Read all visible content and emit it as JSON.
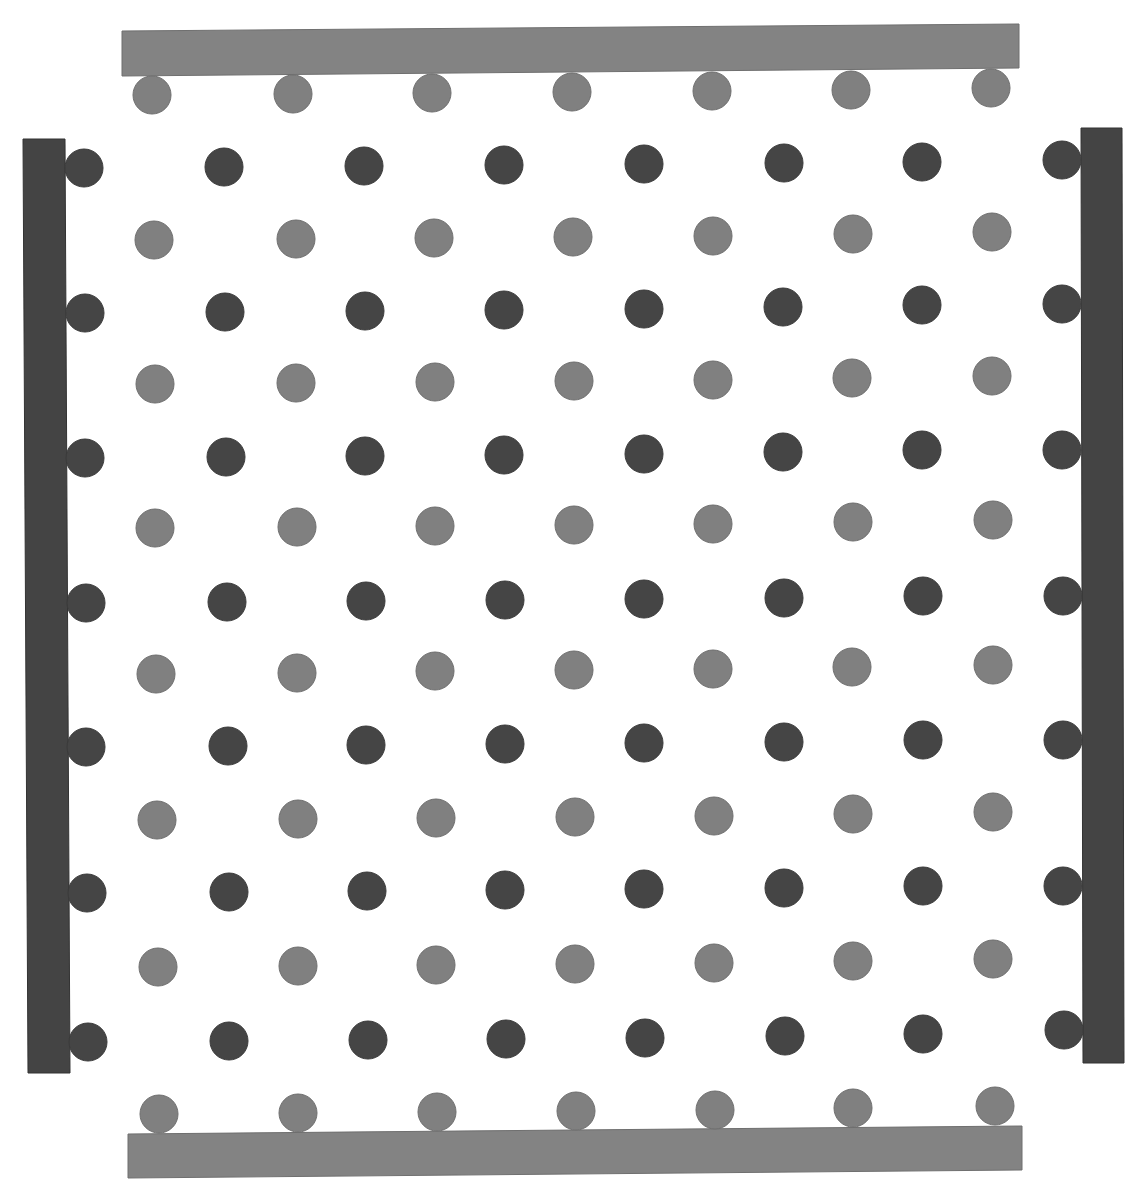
{
  "diagram": {
    "width": 1146,
    "height": 1200,
    "background": "#ffffff",
    "colors": {
      "dark_particle": "#454545",
      "light_particle": "#808080",
      "dark_plate": "#444444",
      "light_plate": "#838383"
    },
    "particle_radius": 19,
    "plates": [
      {
        "name": "top-plate",
        "kind": "light",
        "points": [
          [
            122,
            31
          ],
          [
            1019,
            24
          ],
          [
            1019,
            68
          ],
          [
            122,
            76
          ]
        ]
      },
      {
        "name": "bottom-plate",
        "kind": "light",
        "points": [
          [
            128,
            1134
          ],
          [
            1022,
            1126
          ],
          [
            1022,
            1170
          ],
          [
            128,
            1178
          ]
        ]
      },
      {
        "name": "left-plate",
        "kind": "dark",
        "points": [
          [
            23,
            139
          ],
          [
            65,
            139
          ],
          [
            70,
            1073
          ],
          [
            28,
            1073
          ]
        ]
      },
      {
        "name": "right-plate",
        "kind": "dark",
        "points": [
          [
            1081,
            128
          ],
          [
            1122,
            128
          ],
          [
            1124,
            1063
          ],
          [
            1083,
            1063
          ]
        ]
      }
    ],
    "light_rows": [
      {
        "y": [
          95,
          94,
          93,
          92,
          91,
          90,
          88
        ],
        "x": [
          152,
          293,
          432,
          572,
          712,
          851,
          991
        ]
      },
      {
        "y": [
          240,
          239,
          238,
          237,
          236,
          234,
          232
        ],
        "x": [
          154,
          296,
          434,
          573,
          713,
          853,
          992
        ]
      },
      {
        "y": [
          384,
          383,
          382,
          381,
          380,
          378,
          376
        ],
        "x": [
          155,
          296,
          435,
          574,
          713,
          852,
          992
        ]
      },
      {
        "y": [
          528,
          527,
          526,
          525,
          524,
          522,
          520
        ],
        "x": [
          155,
          297,
          435,
          574,
          713,
          853,
          993
        ]
      },
      {
        "y": [
          674,
          673,
          671,
          670,
          669,
          667,
          665
        ],
        "x": [
          156,
          297,
          435,
          574,
          713,
          852,
          993
        ]
      },
      {
        "y": [
          820,
          819,
          818,
          817,
          816,
          814,
          812
        ],
        "x": [
          157,
          298,
          436,
          575,
          714,
          853,
          993
        ]
      },
      {
        "y": [
          967,
          966,
          965,
          964,
          963,
          961,
          959
        ],
        "x": [
          158,
          298,
          436,
          575,
          714,
          853,
          993
        ]
      },
      {
        "y": [
          1114,
          1113,
          1112,
          1111,
          1110,
          1108,
          1106
        ],
        "x": [
          159,
          298,
          437,
          576,
          715,
          853,
          995
        ]
      }
    ],
    "dark_rows": [
      {
        "y": [
          168,
          167,
          166,
          165,
          164,
          163,
          162,
          160
        ],
        "x": [
          84,
          224,
          364,
          504,
          644,
          784,
          922,
          1062
        ]
      },
      {
        "y": [
          313,
          312,
          311,
          310,
          309,
          307,
          305,
          304
        ],
        "x": [
          85,
          225,
          365,
          504,
          644,
          783,
          922,
          1062
        ]
      },
      {
        "y": [
          458,
          457,
          456,
          455,
          454,
          452,
          450,
          450
        ],
        "x": [
          85,
          226,
          365,
          504,
          644,
          783,
          922,
          1062
        ]
      },
      {
        "y": [
          603,
          602,
          601,
          600,
          599,
          598,
          596,
          596
        ],
        "x": [
          86,
          227,
          366,
          505,
          644,
          784,
          923,
          1063
        ]
      },
      {
        "y": [
          747,
          746,
          745,
          744,
          743,
          742,
          740,
          740
        ],
        "x": [
          86,
          228,
          366,
          505,
          644,
          784,
          923,
          1063
        ]
      },
      {
        "y": [
          893,
          892,
          891,
          890,
          889,
          888,
          886,
          886
        ],
        "x": [
          87,
          229,
          367,
          505,
          644,
          784,
          923,
          1063
        ]
      },
      {
        "y": [
          1042,
          1041,
          1040,
          1039,
          1038,
          1036,
          1034,
          1030
        ],
        "x": [
          88,
          229,
          368,
          506,
          645,
          785,
          923,
          1064
        ]
      }
    ]
  }
}
